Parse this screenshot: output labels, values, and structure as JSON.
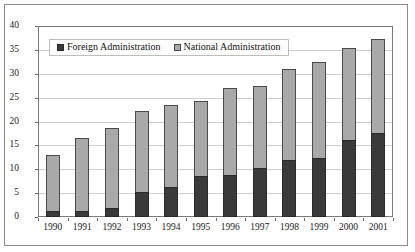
{
  "chart_data": {
    "type": "bar",
    "subtype": "stacked-vertical",
    "title": "",
    "xlabel": "",
    "ylabel": "",
    "ylim": [
      0,
      40
    ],
    "ytick_step": 5,
    "yticks": [
      "40",
      "35",
      "30",
      "25",
      "20",
      "15",
      "10",
      "5",
      "0"
    ],
    "grid": true,
    "grid_axis": "y",
    "legend_position": "inside-top-left",
    "categories": [
      "1990",
      "1991",
      "1992",
      "1993",
      "1994",
      "1995",
      "1996",
      "1997",
      "1998",
      "1999",
      "2000",
      "2001"
    ],
    "series": [
      {
        "name": "Foreign Administration",
        "color": "#3a3a3a",
        "values": [
          1.3,
          1.3,
          1.8,
          5.3,
          6.2,
          8.5,
          8.9,
          10.2,
          12.0,
          12.3,
          16.2,
          17.5
        ]
      },
      {
        "name": "National Administration",
        "color": "#a9a9a9",
        "values": [
          11.7,
          15.3,
          16.9,
          16.8,
          17.2,
          15.8,
          18.1,
          17.3,
          19.0,
          20.1,
          19.1,
          19.8
        ]
      }
    ],
    "totals": [
      13.0,
      16.6,
      18.7,
      22.1,
      23.4,
      24.3,
      27.0,
      27.5,
      31.0,
      32.4,
      35.3,
      37.3
    ]
  },
  "legend": {
    "items": [
      {
        "label": "Foreign Administration",
        "swatch": "dark-square-icon"
      },
      {
        "label": "National Administration",
        "swatch": "light-square-icon"
      }
    ]
  },
  "colors": {
    "foreign": "#3a3a3a",
    "national": "#a9a9a9",
    "grid": "#cfcfcf",
    "axis": "#7a7a7a",
    "frame": "#8a8a8a",
    "background": "#ffffff",
    "text": "#1a1a1a"
  }
}
